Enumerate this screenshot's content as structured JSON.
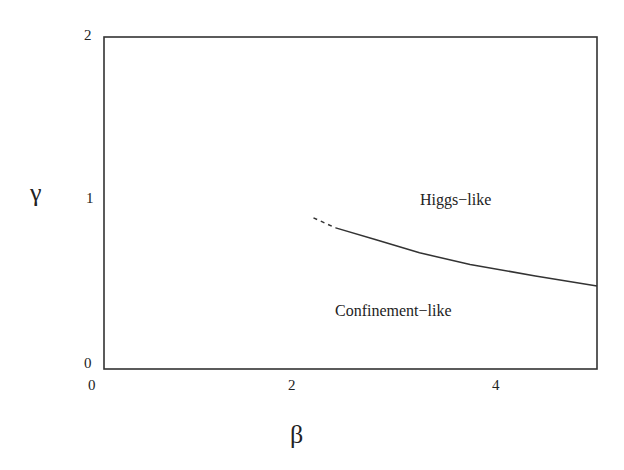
{
  "chart_data": {
    "type": "line",
    "title": "",
    "xlabel": "β",
    "ylabel": "γ",
    "xlim": [
      0,
      4
    ],
    "ylim": [
      0,
      2
    ],
    "x_ticks": [
      "0",
      "2",
      "4"
    ],
    "y_ticks": [
      "0",
      "1",
      "2"
    ],
    "grid": false,
    "legend": null,
    "series": [
      {
        "name": "phase boundary (dashed extrapolation)",
        "style": "dashed",
        "x": [
          1.7,
          1.88
        ],
        "y": [
          0.91,
          0.85
        ]
      },
      {
        "name": "phase boundary",
        "style": "solid",
        "x": [
          1.88,
          2.2,
          2.56,
          2.97,
          3.5,
          4.0
        ],
        "y": [
          0.85,
          0.78,
          0.7,
          0.63,
          0.56,
          0.5
        ]
      }
    ],
    "annotations": [
      {
        "text": "Higgs−like",
        "x": 2.8,
        "y": 1.0
      },
      {
        "text": "Confinement−like",
        "x": 2.6,
        "y": 0.35
      }
    ]
  }
}
